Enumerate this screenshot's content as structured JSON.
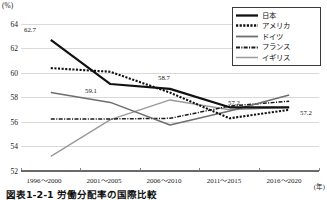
{
  "chart_data": {
    "type": "line",
    "title": "",
    "xlabel": "(年)",
    "ylabel": "(%)",
    "ylim": [
      52,
      64
    ],
    "yticks": [
      52,
      54,
      56,
      58,
      60,
      62,
      64
    ],
    "grid": true,
    "legend_position": "top-right",
    "categories": [
      "1996～2000",
      "2001～2005",
      "2006～2010",
      "2011～2015",
      "2016～2020"
    ],
    "series": [
      {
        "name": "日本",
        "style": "solid-thick-black",
        "color": "#111111",
        "values": [
          62.7,
          59.1,
          58.7,
          57.2,
          57.2
        ]
      },
      {
        "name": "アメリカ",
        "style": "dotted-black",
        "color": "#111111",
        "values": [
          60.4,
          60.1,
          58.4,
          56.3,
          57.0
        ]
      },
      {
        "name": "ドイツ",
        "style": "solid-gray",
        "color": "#6e6e6e",
        "values": [
          58.4,
          57.6,
          55.75,
          56.9,
          58.2
        ]
      },
      {
        "name": "フランス",
        "style": "dash-dot-black",
        "color": "#1a1a1a",
        "values": [
          56.25,
          56.25,
          56.3,
          57.3,
          57.7
        ]
      },
      {
        "name": "イギリス",
        "style": "solid-light-gray",
        "color": "#9a9a9a",
        "values": [
          53.2,
          56.2,
          57.8,
          57.0,
          57.2
        ]
      }
    ],
    "point_labels": [
      {
        "text": "62.7",
        "series": "日本",
        "category": "1996～2000",
        "value": 62.7
      },
      {
        "text": "59.1",
        "series": "日本",
        "category": "2001～2005",
        "value": 59.1
      },
      {
        "text": "58.7",
        "series": "日本",
        "category": "2006～2010",
        "value": 58.7
      },
      {
        "text": "57.2",
        "series": "日本",
        "category": "2011～2015",
        "value": 57.2
      },
      {
        "text": "57.2",
        "series": "日本",
        "category": "2016～2020",
        "value": 57.2
      }
    ]
  },
  "axis": {
    "y_unit": "(%)",
    "x_unit": "(年)",
    "y_tick_labels": [
      "64",
      "62",
      "60",
      "58",
      "56",
      "54",
      "52"
    ]
  },
  "legend": {
    "items": [
      {
        "label": "日本"
      },
      {
        "label": "アメリカ"
      },
      {
        "label": "ドイツ"
      },
      {
        "label": "フランス"
      },
      {
        "label": "イギリス"
      }
    ]
  },
  "caption": {
    "text": "図表1-2-1 労働分配率の国際比較"
  }
}
